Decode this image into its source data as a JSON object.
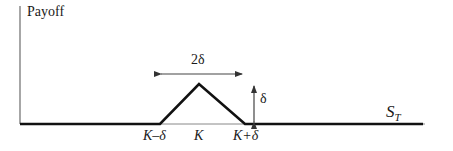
{
  "diagram": {
    "y_axis_label": "Payoff",
    "x_axis_label_main": "S",
    "x_axis_label_sub": "T",
    "tick_labels": {
      "left": "K–δ",
      "center": "K",
      "right": "K+δ"
    },
    "width_annotation": "2δ",
    "height_annotation": "δ",
    "colors": {
      "payoff_line": "#111111",
      "axis": "#555555",
      "arrows": "#333333"
    }
  }
}
